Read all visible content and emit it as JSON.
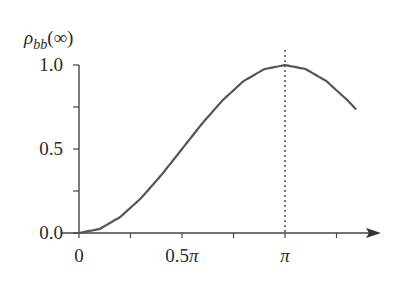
{
  "chart_data": {
    "type": "line",
    "title": "",
    "ylabel": "ρ_bb(∞)",
    "ylabel_main": "ρ",
    "ylabel_sub": "bb",
    "ylabel_arg": "(∞)",
    "xlabel": "",
    "xlim": [
      0,
      1.345
    ],
    "xlim_units": "π",
    "ylim": [
      0,
      1.0
    ],
    "x_ticks": [
      0,
      0.25,
      0.5,
      0.75,
      1.0,
      1.25
    ],
    "x_tick_labels": [
      "0",
      "0.5π",
      "π"
    ],
    "x_tick_label_positions": [
      0,
      0.5,
      1.0
    ],
    "y_ticks": [
      0,
      0.25,
      0.5,
      0.75,
      1.0
    ],
    "y_tick_labels": [
      "0.0",
      "0.5",
      "1.0"
    ],
    "y_tick_label_positions": [
      0,
      0.5,
      1.0
    ],
    "grid": false,
    "legend": null,
    "annotations": [
      {
        "type": "vertical-dotted-line",
        "x": 1.0,
        "x_units": "π"
      }
    ],
    "series": [
      {
        "name": "rho_bb",
        "x_units": "π",
        "x": [
          0,
          0.1,
          0.2,
          0.3,
          0.4,
          0.5,
          0.6,
          0.7,
          0.8,
          0.9,
          1.0,
          1.1,
          1.2,
          1.3,
          1.345
        ],
        "values": [
          0,
          0.024,
          0.095,
          0.206,
          0.345,
          0.5,
          0.655,
          0.794,
          0.905,
          0.976,
          1.0,
          0.976,
          0.905,
          0.794,
          0.735
        ]
      }
    ],
    "line_color": "#555555"
  }
}
